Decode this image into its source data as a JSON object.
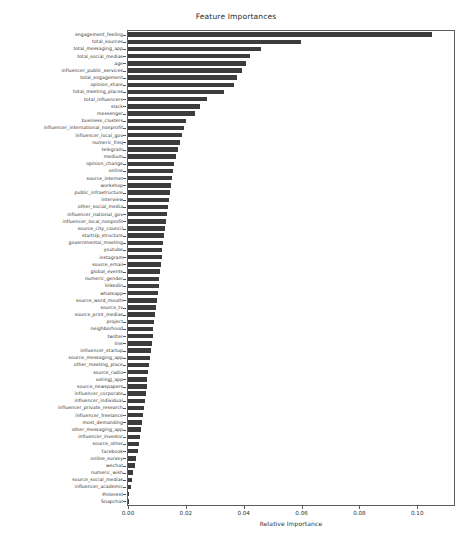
{
  "chart_data": {
    "type": "bar",
    "orientation": "horizontal",
    "title": "Feature Importances",
    "xlabel": "Relative Importance",
    "ylabel": "",
    "xlim": [
      0.0,
      0.1127
    ],
    "grid": false,
    "legend": null,
    "bar_color": "#3c3c3c",
    "xticks": [
      0.0,
      0.02,
      0.04,
      0.06,
      0.08,
      0.1
    ],
    "xtick_labels": [
      "0.00",
      "0.02",
      "0.04",
      "0.06",
      "0.08",
      "0.10"
    ],
    "categories": [
      "engagement_feeling",
      "total_sources",
      "total_messaging_app",
      "total_social_medias",
      "age",
      "influencer_public_services",
      "total_engagement",
      "opinion_share",
      "total_meeting_places",
      "total_influencers",
      "slack",
      "messenger",
      "business_clusters",
      "influencer_international_nonprofit",
      "influencer_local_gov",
      "numeric_freq",
      "telegram",
      "medium",
      "opinion_change",
      "online",
      "source_internet",
      "workshop",
      "public_infrastructure",
      "interview",
      "other_social_media",
      "influencer_national_gov",
      "influencer_local_nonprofit",
      "source_city_council",
      "startUp_structure",
      "governmental_meeting",
      "youtube",
      "instagram",
      "source_email",
      "global_events",
      "numeric_gender",
      "linkedin",
      "whatsapp",
      "source_word_mouth",
      "source_tv",
      "source_print_medias",
      "project",
      "neighborhood",
      "twitter",
      "line",
      "influencer_startup",
      "source_messaging_app",
      "other_meeting_place",
      "source_radio",
      "votingJ_app",
      "source_newspapers",
      "influencer_corporate",
      "influencer_individual",
      "influencer_private_research",
      "influencer_freelance",
      "most_demanding",
      "other_messaging_app",
      "influencer_investor",
      "source_other",
      "facebook",
      "online_survey",
      "wechat",
      "numeric_wish",
      "source_social_medias",
      "influencer_academic",
      "Pinterest",
      "Snapchat"
    ],
    "values": [
      0.1051,
      0.0598,
      0.0459,
      0.0421,
      0.0409,
      0.0393,
      0.0377,
      0.0365,
      0.0332,
      0.0272,
      0.0249,
      0.0232,
      0.0199,
      0.0193,
      0.0186,
      0.0179,
      0.0172,
      0.0165,
      0.016,
      0.0156,
      0.0152,
      0.0148,
      0.0144,
      0.0141,
      0.0138,
      0.0134,
      0.0131,
      0.0128,
      0.0125,
      0.0122,
      0.0119,
      0.0116,
      0.0113,
      0.011,
      0.0108,
      0.0106,
      0.0103,
      0.01,
      0.0097,
      0.0094,
      0.0091,
      0.0088,
      0.0085,
      0.0082,
      0.0079,
      0.0076,
      0.0073,
      0.007,
      0.0067,
      0.0064,
      0.0061,
      0.0058,
      0.0055,
      0.0052,
      0.0049,
      0.0045,
      0.0042,
      0.0038,
      0.0034,
      0.0029,
      0.0024,
      0.0019,
      0.0014,
      0.001,
      0.0005,
      0.0002
    ]
  }
}
